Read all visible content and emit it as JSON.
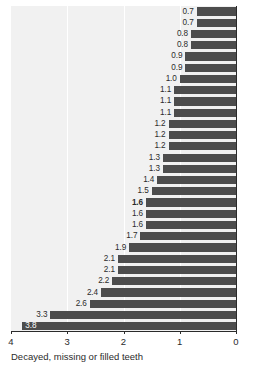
{
  "chart_data": {
    "type": "bar",
    "orientation": "horizontal",
    "title": "",
    "subtitle": "",
    "xlabel": "Decayed, missing or filled teeth",
    "ylabel": "",
    "xlim": [
      4,
      0
    ],
    "x_axis_reversed": true,
    "xticks": [
      4,
      3,
      2,
      1,
      0
    ],
    "xtick_labels": [
      "4",
      "3",
      "2",
      "1",
      "0"
    ],
    "grid": true,
    "grid_axis": "x",
    "legend": "none",
    "bar_color": "#4d4d4d",
    "plot_background": "#f1f1f1",
    "gridline_color": "#ffffff",
    "highlight_index": 17,
    "categories": [
      "",
      "",
      "",
      "",
      "",
      "",
      "",
      "",
      "",
      "",
      "",
      "",
      "",
      "",
      "",
      "",
      "",
      "",
      "",
      "",
      "",
      "",
      "",
      "",
      "",
      "",
      "",
      "",
      ""
    ],
    "values": [
      0.7,
      0.7,
      0.8,
      0.8,
      0.9,
      0.9,
      1.0,
      1.1,
      1.1,
      1.1,
      1.2,
      1.2,
      1.2,
      1.3,
      1.3,
      1.4,
      1.5,
      1.6,
      1.6,
      1.6,
      1.7,
      1.9,
      2.1,
      2.1,
      2.2,
      2.4,
      2.6,
      3.3,
      3.8
    ],
    "data_labels": [
      "0.7",
      "0.7",
      "0.8",
      "0.8",
      "0.9",
      "0.9",
      "1.0",
      "1.1",
      "1.1",
      "1.1",
      "1.2",
      "1.2",
      "1.2",
      "1.3",
      "1.3",
      "1.4",
      "1.5",
      "1.6",
      "1.6",
      "1.6",
      "1.7",
      "1.9",
      "2.1",
      "2.1",
      "2.2",
      "2.4",
      "2.6",
      "3.3",
      "3.8"
    ],
    "label_bold": [
      false,
      false,
      false,
      false,
      false,
      false,
      false,
      false,
      false,
      false,
      false,
      false,
      false,
      false,
      false,
      false,
      false,
      true,
      false,
      false,
      false,
      false,
      false,
      false,
      false,
      false,
      false,
      false,
      false
    ],
    "label_inside_bar": [
      false,
      false,
      false,
      false,
      false,
      false,
      false,
      false,
      false,
      false,
      false,
      false,
      false,
      false,
      false,
      false,
      false,
      false,
      false,
      false,
      false,
      false,
      false,
      false,
      false,
      false,
      false,
      false,
      true
    ]
  }
}
